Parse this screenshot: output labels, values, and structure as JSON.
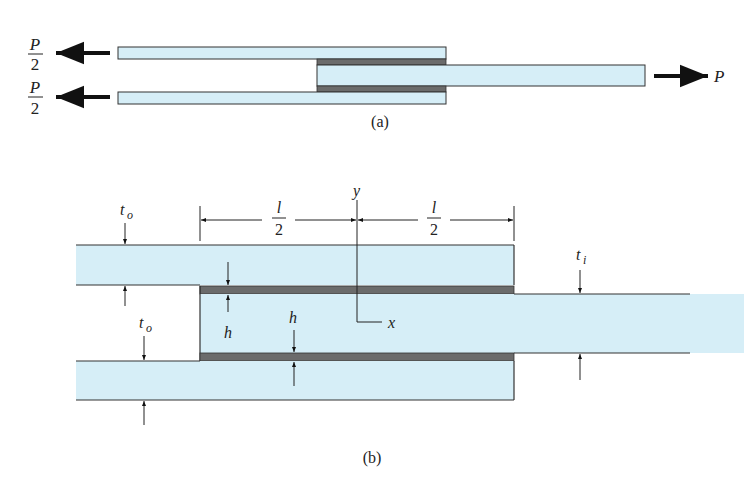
{
  "figure": {
    "colors": {
      "adherend_fill": "#d6eef7",
      "adhesive_fill": "#6b6b6b",
      "outline": "#333333",
      "arrow": "#111111"
    },
    "part_a": {
      "caption": "(a)",
      "left_force_top": {
        "numerator": "P",
        "denominator": "2"
      },
      "left_force_bottom": {
        "numerator": "P",
        "denominator": "2"
      },
      "right_force": "P"
    },
    "part_b": {
      "caption": "(b)",
      "axis_y": "y",
      "axis_x": "x",
      "half_length_left": {
        "numerator": "l",
        "denominator": "2"
      },
      "half_length_right": {
        "numerator": "l",
        "denominator": "2"
      },
      "outer_thickness_top": {
        "base": "t",
        "sub": "o"
      },
      "outer_thickness_bottom": {
        "base": "t",
        "sub": "o"
      },
      "inner_thickness": {
        "base": "t",
        "sub": "i"
      },
      "adhesive_thickness_top": "h",
      "adhesive_thickness_bottom": "h"
    }
  }
}
